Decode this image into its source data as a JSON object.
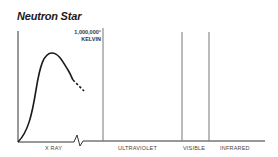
{
  "title": "Neutron Star",
  "temperature_label": {
    "line1": "1,000,000°",
    "line2": "KELVIN"
  },
  "bands": [
    {
      "label": "X RAY"
    },
    {
      "label": "ULTRAVIOLET"
    },
    {
      "label": "VISIBLE"
    },
    {
      "label": "INFRARED"
    }
  ],
  "colors": {
    "curve": "#1a1a1a",
    "axis": "#333333",
    "divider": "#777777"
  }
}
